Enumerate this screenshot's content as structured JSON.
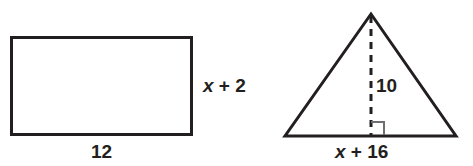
{
  "figure": {
    "background_color": "#ffffff",
    "stroke_color": "#231f20",
    "right_angle_color": "#6d6e71",
    "shapes": [
      {
        "name": "rectangle",
        "type": "rectangle",
        "x": 11,
        "y": 37,
        "width": 181,
        "height": 98,
        "labels": {
          "height": "x + 2",
          "base": "12"
        }
      },
      {
        "name": "triangle",
        "type": "triangle",
        "apex": [
          371,
          14
        ],
        "base_left": [
          285,
          136
        ],
        "base_right": [
          456,
          136
        ],
        "altitude_foot": [
          371,
          136
        ],
        "altitude_dashed": true,
        "right_angle_marker": true,
        "labels": {
          "height": "10",
          "base": "x + 16"
        }
      }
    ]
  },
  "labels": {
    "rect_height_var": "x",
    "rect_height_op": " + ",
    "rect_height_num": "2",
    "rect_base": "12",
    "tri_height": "10",
    "tri_base_var": "x",
    "tri_base_op": " + ",
    "tri_base_num": "16"
  }
}
